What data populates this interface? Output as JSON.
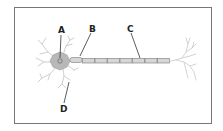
{
  "diagram": {
    "labels": [
      {
        "id": "A",
        "text": "A",
        "points_to": "cell body nucleus"
      },
      {
        "id": "B",
        "text": "B",
        "points_to": "axon hillock / start of axon"
      },
      {
        "id": "C",
        "text": "C",
        "points_to": "myelinated axon segment"
      },
      {
        "id": "D",
        "text": "D",
        "points_to": "dendrite"
      }
    ],
    "colors": {
      "border": "#777777",
      "cell_body": "#b8b8b8",
      "dendrites": "#c8c8c8",
      "axon_fill": "#d6d6d6",
      "axon_stroke": "#888888",
      "leader_lines": "#333333"
    }
  }
}
